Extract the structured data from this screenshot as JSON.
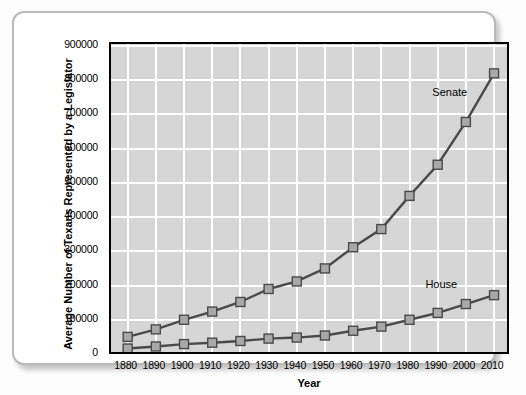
{
  "chart_data": {
    "type": "line",
    "title": "",
    "xlabel": "Year",
    "ylabel": "Average Number of Texans Represented by a Legislator",
    "categories": [
      1880,
      1890,
      1900,
      1910,
      1920,
      1930,
      1940,
      1950,
      1960,
      1970,
      1980,
      1990,
      2000,
      2010
    ],
    "xlim": [
      1880,
      2010
    ],
    "ylim": [
      0,
      900000
    ],
    "yticks": [
      "0",
      "100000",
      "200000",
      "300000",
      "400000",
      "500000",
      "600000",
      "700000",
      "800000",
      "900000"
    ],
    "ytick_values": [
      0,
      100000,
      200000,
      300000,
      400000,
      500000,
      600000,
      700000,
      800000,
      900000
    ],
    "xticks": [
      "1880",
      "1890",
      "1900",
      "1910",
      "1920",
      "1930",
      "1940",
      "1950",
      "1960",
      "1970",
      "1980",
      "1990",
      "2000",
      "2010"
    ],
    "grid": true,
    "legend_position": "inline-annotations",
    "marker": "square",
    "series": [
      {
        "name": "Senate",
        "label_x": 1995,
        "label_y": 760000,
        "values": [
          50000,
          72000,
          100000,
          124000,
          152000,
          190000,
          212000,
          250000,
          312000,
          365000,
          462000,
          553000,
          678000,
          820000
        ]
      },
      {
        "name": "House",
        "label_x": 1992,
        "label_y": 200000,
        "values": [
          16000,
          22000,
          29000,
          33000,
          38000,
          45000,
          48000,
          54000,
          68000,
          80000,
          100000,
          120000,
          146000,
          172000
        ]
      }
    ]
  },
  "series_labels": {
    "senate": "Senate",
    "house": "House"
  },
  "axis": {
    "x_title": "Year",
    "y_title": "Average Number of Texans Represented by a Legislator"
  }
}
